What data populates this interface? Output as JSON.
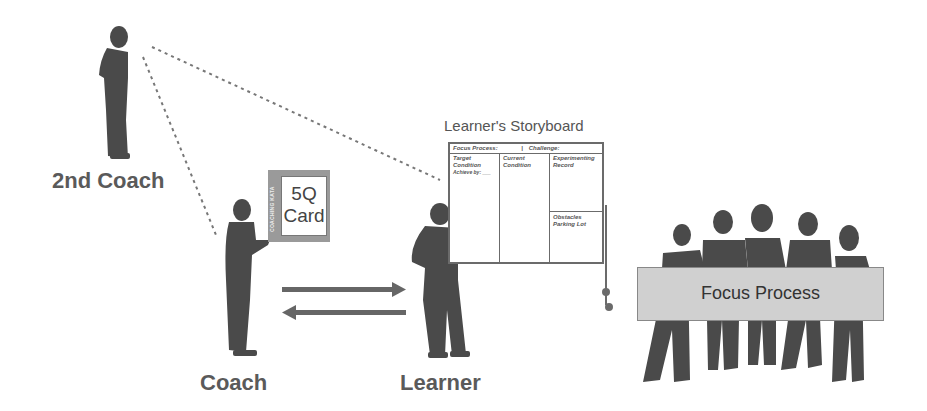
{
  "diagram": {
    "roles": {
      "second_coach": "2nd Coach",
      "coach": "Coach",
      "learner": "Learner"
    },
    "card": {
      "title_line1": "5Q",
      "title_line2": "Card",
      "side_label": "COACHING KATA"
    },
    "storyboard": {
      "title": "Learner's Storyboard",
      "header_left": "Focus Process:",
      "header_sep": "|",
      "header_right": "Challenge:",
      "columns": {
        "target_line1": "Target",
        "target_line2": "Condition",
        "target_line3": "Achieve by: ___",
        "current_line1": "Current",
        "current_line2": "Condition",
        "experimenting_line1": "Experimenting",
        "experimenting_line2": "Record",
        "obstacles_line1": "Obstacles",
        "obstacles_line2": "Parking Lot"
      }
    },
    "focus_process": {
      "label": "Focus Process"
    },
    "colors": {
      "silhouette": "#4a4a4a",
      "label": "#5a5a5a",
      "card_frame": "#9a9a9a",
      "banner": "#d0d0d0",
      "arrow": "#666666"
    }
  }
}
